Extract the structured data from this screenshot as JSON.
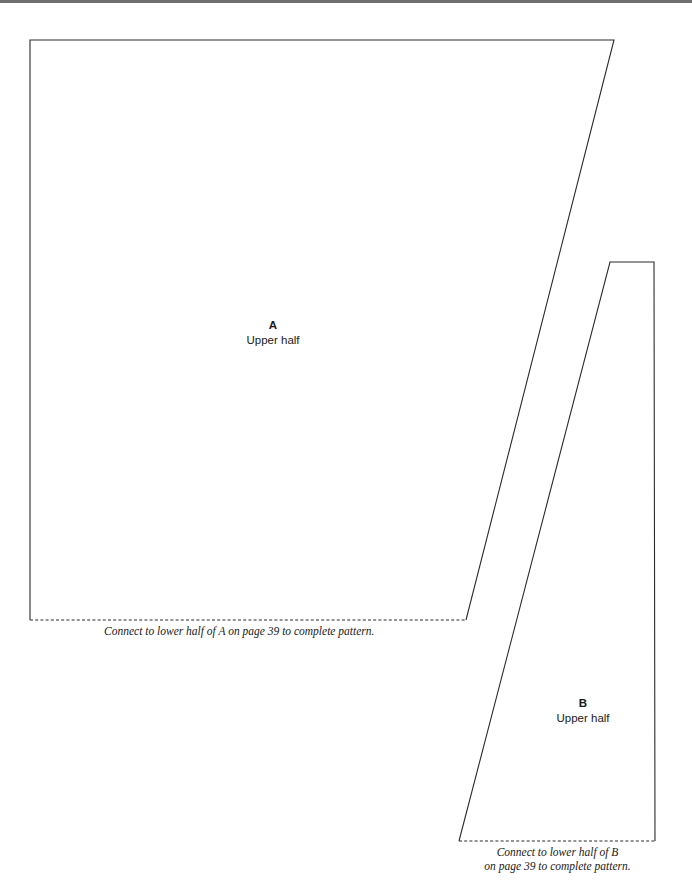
{
  "page": {
    "width": 692,
    "height": 892,
    "background_color": "#ffffff",
    "line_color": "#2b2b2b",
    "top_rule_color": "#6e6e6e"
  },
  "pieces": [
    {
      "id": "A",
      "letter": "A",
      "sublabel": "Upper half",
      "caption": "Connect to lower half of A on page 39 to complete pattern.",
      "outline": {
        "solid_path": "M 30 620 L 30 40 L 614 40 L 466 620",
        "dashed_path": "M 30 620 L 466 620",
        "points": [
          [
            30,
            40
          ],
          [
            614,
            40
          ],
          [
            466,
            620
          ],
          [
            30,
            620
          ]
        ]
      }
    },
    {
      "id": "B",
      "letter": "B",
      "sublabel": "Upper half",
      "caption_line1": "Connect to lower half of B",
      "caption_line2": "on page 39 to complete pattern.",
      "outline": {
        "solid_path": "M 459 841 L 610 262 L 654 262 L 655 841",
        "dashed_path": "M 459 841 L 655 841",
        "points": [
          [
            610,
            262
          ],
          [
            654,
            262
          ],
          [
            655,
            841
          ],
          [
            459,
            841
          ]
        ]
      }
    }
  ]
}
